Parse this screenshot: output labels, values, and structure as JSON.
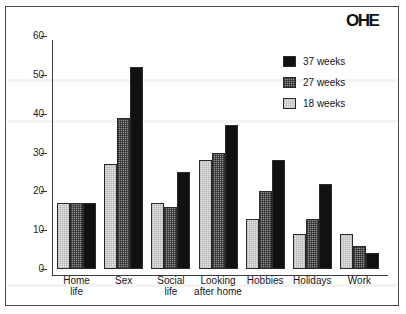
{
  "figure": {
    "title": "",
    "logo": {
      "name": "ohe-logo",
      "text": "OHE"
    }
  },
  "legend": {
    "position": "top-right",
    "entries": [
      {
        "label": "37 weeks",
        "color": "#111111",
        "series_key": "s37"
      },
      {
        "label": "27 weeks",
        "color": "#8d8d8d",
        "series_key": "s27"
      },
      {
        "label": "18 weeks",
        "color": "#e8e8e6",
        "series_key": "s18"
      }
    ]
  },
  "axis": {
    "y_ticks": [
      "0",
      "10",
      "20",
      "30",
      "40",
      "50",
      "60"
    ],
    "x_labels": [
      "Home\nlife",
      "Sex",
      "Social\nlife",
      "Looking\nafter home",
      "Hobbies",
      "Holidays",
      "Work"
    ]
  },
  "chart_data": {
    "type": "bar",
    "title": "",
    "xlabel": "",
    "ylabel": "",
    "ylim": [
      0,
      60
    ],
    "ytick_step": 10,
    "grid": false,
    "legend_position": "top-right",
    "categories": [
      "Home life",
      "Sex",
      "Social life",
      "Looking after home",
      "Hobbies",
      "Holidays",
      "Work"
    ],
    "series": [
      {
        "name": "18 weeks",
        "color": "#e8e8e6",
        "values": [
          17,
          27,
          17,
          28,
          13,
          9,
          9
        ]
      },
      {
        "name": "27 weeks",
        "color": "#8d8d8d",
        "values": [
          17,
          39,
          16,
          30,
          20,
          13,
          6
        ]
      },
      {
        "name": "37 weeks",
        "color": "#111111",
        "values": [
          17,
          52,
          25,
          37,
          28,
          22,
          4
        ]
      }
    ]
  }
}
